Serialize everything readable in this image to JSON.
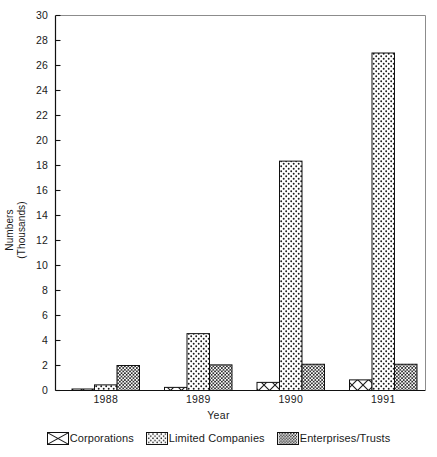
{
  "chart_data": {
    "type": "bar",
    "title": "",
    "xlabel": "Year",
    "ylabel": "Numbers (Thousands)",
    "ylabel_line1": "Numbers",
    "ylabel_line2": "(Thousands)",
    "categories": [
      "1988",
      "1989",
      "1990",
      "1991"
    ],
    "ylim": [
      0,
      30
    ],
    "ytick_labels": [
      "0",
      "2",
      "4",
      "6",
      "8",
      "10",
      "12",
      "14",
      "16",
      "18",
      "20",
      "22",
      "24",
      "26",
      "28",
      "30"
    ],
    "ytick_values": [
      0,
      2,
      4,
      6,
      8,
      10,
      12,
      14,
      16,
      18,
      20,
      22,
      24,
      26,
      28,
      30
    ],
    "grid": false,
    "legend_position": "bottom",
    "series": [
      {
        "name": "Corporations",
        "pattern": "bowtie-hatch",
        "values": [
          0.12,
          0.25,
          0.65,
          0.85
        ]
      },
      {
        "name": "Limited Companies",
        "pattern": "light-dots",
        "values": [
          0.45,
          4.55,
          18.35,
          27.0
        ]
      },
      {
        "name": "Enterprises/Trusts",
        "pattern": "dense-dots",
        "values": [
          2.0,
          2.05,
          2.1,
          2.1
        ]
      }
    ]
  },
  "legend": {
    "items": [
      {
        "label": "Corporations"
      },
      {
        "label": "Limited Companies"
      },
      {
        "label": "Enterprises/Trusts"
      }
    ]
  },
  "colors": {
    "axis": "#111111",
    "bar_outline": "#111111",
    "background": "#ffffff",
    "pattern_ink": "#1a1a1a"
  }
}
